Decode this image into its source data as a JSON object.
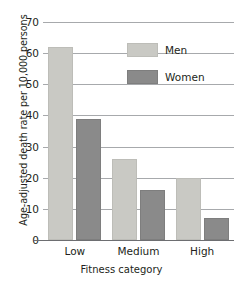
{
  "chart_data": {
    "type": "bar",
    "title": "",
    "subtitle": "",
    "xlabel": "Fitness category",
    "ylabel": "Age-adjusted death rate per 10,000 persons",
    "categories": [
      "Low",
      "Medium",
      "High"
    ],
    "series": [
      {
        "name": "Men",
        "color": "#c9c9c4",
        "values": [
          62,
          26,
          20
        ]
      },
      {
        "name": "Women",
        "color": "#8a8a8a",
        "values": [
          39,
          16,
          7
        ]
      }
    ],
    "ylim": [
      0,
      70
    ],
    "ytick_values": [
      0,
      10,
      20,
      30,
      40,
      50,
      60,
      70
    ],
    "ytick_labels": [
      "0",
      "10",
      "20",
      "30",
      "40",
      "50",
      "60",
      "70"
    ],
    "grid": "horizontal",
    "legend_position": "upper-right-inside",
    "legend_entries": [
      "Men",
      "Women"
    ],
    "axis_color": "#6d6e71",
    "gridline_color": "#a7a9ac",
    "background": "#ffffff"
  }
}
